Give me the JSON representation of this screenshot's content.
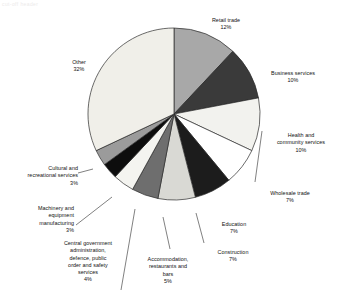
{
  "artifact_text": "cut-off header",
  "chart_data": {
    "type": "pie",
    "title": "",
    "xlabel": "",
    "ylabel": "",
    "legend_position": "outside-labels",
    "grid": false,
    "units": "percent",
    "start_angle_deg": 0,
    "direction": "clockwise",
    "categories": [
      "Retail trade",
      "Business services",
      "Health and community services",
      "Wholesale trade",
      "Education",
      "Construction",
      "Accommodation, restaurants and bars",
      "Central government administration, defence, public order and safety services",
      "Machinery and equipment manufacturing",
      "Cultural and recreational services",
      "Other"
    ],
    "values": [
      12,
      10,
      10,
      7,
      7,
      7,
      5,
      4,
      3,
      3,
      32
    ],
    "colors": [
      "#a8a8a8",
      "#3a3a3a",
      "#f2f2ee",
      "#ffffff",
      "#1c1c1c",
      "#d9d9d4",
      "#6e6e6e",
      "#f4f4f0",
      "#0d0d0d",
      "#9b9b9b",
      "#f0efe9"
    ],
    "slices": [
      {
        "label": "Retail trade",
        "percent_text": "12%",
        "value": 12,
        "color": "#a8a8a8"
      },
      {
        "label": "Business services",
        "percent_text": "10%",
        "value": 10,
        "color": "#3a3a3a"
      },
      {
        "label": "Health and\ncommunity services",
        "percent_text": "10%",
        "value": 10,
        "color": "#f2f2ee"
      },
      {
        "label": "Wholesale trade",
        "percent_text": "7%",
        "value": 7,
        "color": "#ffffff"
      },
      {
        "label": "Education",
        "percent_text": "7%",
        "value": 7,
        "color": "#1c1c1c"
      },
      {
        "label": "Construction",
        "percent_text": "7%",
        "value": 7,
        "color": "#d9d9d4"
      },
      {
        "label": "Accommodation,\nrestaurants and\nbars",
        "percent_text": "5%",
        "value": 5,
        "color": "#6e6e6e"
      },
      {
        "label": "Central government\nadministration,\ndefence, public\norder and safety\nservices",
        "percent_text": "4%",
        "value": 4,
        "color": "#f4f4f0"
      },
      {
        "label": "Machinery and\nequipment\nmanufacturing",
        "percent_text": "3%",
        "value": 3,
        "color": "#0d0d0d"
      },
      {
        "label": "Cultural and\nrecreational services",
        "percent_text": "3%",
        "value": 3,
        "color": "#9b9b9b"
      },
      {
        "label": "Other",
        "percent_text": "32%",
        "value": 32,
        "color": "#f0efe9"
      }
    ]
  },
  "labels": {
    "retail_trade": {
      "name": "Retail trade",
      "pct": "12%"
    },
    "business": {
      "name": "Business services",
      "pct": "10%"
    },
    "health": {
      "name": "Health and\ncommunity services",
      "pct": "10%"
    },
    "wholesale": {
      "name": "Wholesale trade",
      "pct": "7%"
    },
    "education": {
      "name": "Education",
      "pct": "7%"
    },
    "construction": {
      "name": "Construction",
      "pct": "7%"
    },
    "accommodation": {
      "name": "Accommodation,\nrestaurants and\nbars",
      "pct": "5%"
    },
    "central_gov": {
      "name": "Central government\nadministration,\ndefence, public\norder and safety\nservices",
      "pct": "4%"
    },
    "machinery": {
      "name": "Machinery and\nequipment\nmanufacturing",
      "pct": "3%"
    },
    "cultural": {
      "name": "Cultural and\nrecreational services",
      "pct": "3%"
    },
    "other": {
      "name": "Other",
      "pct": "32%"
    }
  }
}
